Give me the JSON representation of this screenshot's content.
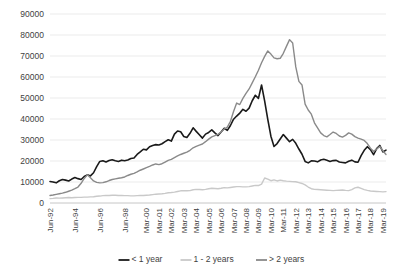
{
  "chart_data": {
    "type": "line",
    "title": "",
    "xlabel": "",
    "ylabel": "",
    "ylim": [
      0,
      90000
    ],
    "ytick_step": 10000,
    "grid": true,
    "legend_position": "bottom",
    "yticks": [
      "0",
      "10000",
      "20000",
      "30000",
      "40000",
      "50000",
      "60000",
      "70000",
      "80000",
      "90000"
    ],
    "xticks": [
      "Jun-92",
      "Jun-94",
      "Jun-96",
      "Jun-98",
      "Mar-00",
      "Mar-01",
      "Mar-02",
      "Mar-03",
      "Mar-04",
      "Mar-05",
      "Mar-06",
      "Mar-07",
      "Mar-08",
      "Mar-09",
      "Mar-10",
      "Mar-11",
      "Mar-12",
      "Mar-13",
      "Mar-14",
      "Mar-15",
      "Mar-16",
      "Mar-17",
      "Mar-18",
      "Mar-19"
    ],
    "xtick_index": [
      0,
      8,
      16,
      24,
      31,
      35,
      39,
      43,
      47,
      51,
      55,
      59,
      63,
      67,
      71,
      75,
      79,
      83,
      87,
      91,
      95,
      99,
      103,
      107
    ],
    "x_count": 109,
    "series": [
      {
        "name": "< 1 year",
        "color": "#1a1a1a",
        "width": 1.6,
        "values": [
          10200,
          10000,
          9600,
          10600,
          11200,
          10900,
          10500,
          11400,
          12100,
          11600,
          11200,
          12600,
          13400,
          12900,
          14400,
          17300,
          19800,
          20100,
          19500,
          20200,
          20600,
          20100,
          19800,
          20400,
          20100,
          20500,
          21200,
          21400,
          23100,
          24300,
          25600,
          25300,
          26800,
          27400,
          27800,
          27600,
          28200,
          29200,
          30100,
          29500,
          32800,
          34300,
          33900,
          31700,
          31200,
          33200,
          35800,
          34100,
          32500,
          30900,
          32800,
          33600,
          34800,
          33400,
          32100,
          33800,
          35600,
          34600,
          36900,
          39900,
          41400,
          42800,
          44600,
          43700,
          45200,
          48700,
          51300,
          49800,
          56200,
          48500,
          39800,
          31800,
          26900,
          28300,
          30500,
          32600,
          30900,
          29200,
          30300,
          28400,
          25700,
          23200,
          19800,
          19100,
          20100,
          20000,
          19600,
          20500,
          20800,
          20400,
          19800,
          20200,
          20300,
          19500,
          19300,
          19100,
          19900,
          20400,
          19600,
          19400,
          22600,
          25100,
          26800,
          25400,
          23000,
          25900,
          27400,
          24300,
          25200
        ]
      },
      {
        "name": "1 - 2 years",
        "color": "#c9c9c9",
        "width": 1.4,
        "values": [
          2100,
          2200,
          2400,
          2300,
          2400,
          2500,
          2600,
          2500,
          2600,
          2700,
          2700,
          2800,
          2800,
          2900,
          3000,
          3200,
          3300,
          3500,
          3600,
          3600,
          3700,
          3700,
          3600,
          3600,
          3500,
          3500,
          3400,
          3400,
          3500,
          3600,
          3600,
          3700,
          3800,
          4000,
          4200,
          4300,
          4400,
          4600,
          4900,
          5000,
          5200,
          5500,
          5800,
          5900,
          5800,
          5900,
          6300,
          6500,
          6400,
          6300,
          6500,
          6800,
          7000,
          6900,
          6800,
          7000,
          7300,
          7200,
          7400,
          7600,
          7800,
          7800,
          7700,
          7700,
          7800,
          8100,
          8400,
          8300,
          9000,
          11900,
          11400,
          10600,
          11000,
          10500,
          10900,
          10600,
          10400,
          10300,
          10200,
          10100,
          9700,
          9300,
          8600,
          7600,
          6800,
          6500,
          6400,
          6300,
          6200,
          6100,
          6000,
          5900,
          6000,
          6100,
          6200,
          6000,
          5900,
          6400,
          7200,
          7500,
          7000,
          6400,
          6000,
          5700,
          5600,
          5500,
          5400,
          5300,
          5400
        ]
      },
      {
        "name": "> 2 years",
        "color": "#8a8a8a",
        "width": 1.4,
        "values": [
          3600,
          3800,
          4100,
          4400,
          4700,
          5100,
          5600,
          6100,
          6800,
          7600,
          9400,
          11700,
          13400,
          12000,
          10500,
          9800,
          9600,
          9700,
          10100,
          10700,
          11200,
          11500,
          11800,
          12000,
          12400,
          13100,
          13700,
          14100,
          14800,
          15600,
          16200,
          16800,
          17400,
          18100,
          18600,
          18300,
          18700,
          19500,
          20300,
          20800,
          21600,
          22400,
          23100,
          23700,
          24200,
          25100,
          26300,
          27000,
          27600,
          28100,
          29200,
          30400,
          31500,
          32100,
          32700,
          33800,
          35200,
          36100,
          38900,
          43600,
          47600,
          46900,
          49800,
          52200,
          54300,
          57200,
          60100,
          63200,
          66800,
          69800,
          72400,
          70900,
          69100,
          68700,
          68900,
          71300,
          74600,
          77800,
          76200,
          64800,
          57900,
          56200,
          47100,
          44300,
          42300,
          38200,
          35800,
          33400,
          32100,
          31500,
          32600,
          33800,
          33100,
          31900,
          31400,
          32200,
          33400,
          32800,
          31600,
          30900,
          30400,
          29800,
          28300,
          26100,
          24600,
          25700,
          26900,
          24900,
          23100
        ]
      }
    ],
    "legend": [
      {
        "label": "< 1 year",
        "color": "#1a1a1a"
      },
      {
        "label": "1 - 2 years",
        "color": "#c9c9c9"
      },
      {
        "label": "> 2 years",
        "color": "#8a8a8a"
      }
    ]
  }
}
